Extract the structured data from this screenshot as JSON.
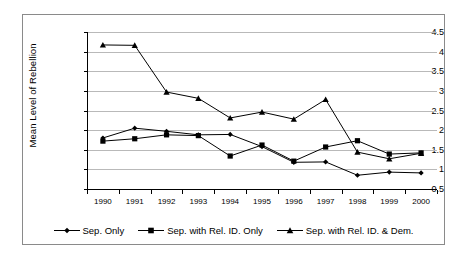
{
  "chart_data": {
    "type": "line",
    "title": "",
    "xlabel": "",
    "ylabel": "Mean Level of Rebellion",
    "categories": [
      "1990",
      "1991",
      "1992",
      "1993",
      "1994",
      "1995",
      "1996",
      "1997",
      "1998",
      "1999",
      "2000"
    ],
    "ylim": [
      0.5,
      4.5
    ],
    "ytick_step": 0.5,
    "yticks": [
      "4.5",
      "4",
      "3.5",
      "3",
      "2.5",
      "2",
      "1.5",
      "1",
      "0.5"
    ],
    "ytick_values": [
      4.5,
      4,
      3.5,
      3,
      2.5,
      2,
      1.5,
      1,
      0.5
    ],
    "grid": true,
    "legend_position": "bottom",
    "series": [
      {
        "name": "Sep. Only",
        "marker": "diamond",
        "values": [
          1.8,
          2.05,
          1.97,
          1.88,
          1.89,
          1.58,
          1.18,
          1.19,
          0.85,
          0.93,
          0.91
        ]
      },
      {
        "name": "Sep. with Rel. ID. Only",
        "marker": "square",
        "values": [
          1.72,
          1.78,
          1.88,
          1.86,
          1.34,
          1.62,
          1.21,
          1.57,
          1.73,
          1.39,
          1.42
        ]
      },
      {
        "name": "Sep. with Rel. ID. & Dem.",
        "marker": "triangle",
        "values": [
          4.17,
          4.16,
          2.97,
          2.81,
          2.31,
          2.46,
          2.28,
          2.78,
          1.44,
          1.27,
          1.41
        ]
      }
    ]
  },
  "legend": {
    "items": [
      {
        "label": "Sep. Only",
        "marker": "diamond"
      },
      {
        "label": "Sep. with Rel. ID. Only",
        "marker": "square"
      },
      {
        "label": "Sep. with Rel. ID. & Dem.",
        "marker": "triangle"
      }
    ]
  },
  "colors": {
    "series_line": "#000000",
    "gridline": "#b9b9b9",
    "axis": "#000000",
    "frame": "#8a8a8a",
    "background": "#ffffff"
  }
}
